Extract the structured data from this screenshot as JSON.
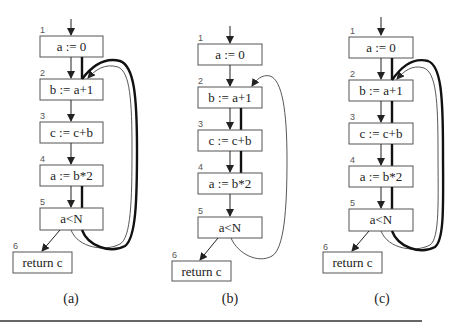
{
  "figure": {
    "diagrams": [
      {
        "caption": "(a)",
        "nodes": [
          {
            "num": "1",
            "label": "a := 0"
          },
          {
            "num": "2",
            "label": "b := a+1"
          },
          {
            "num": "3",
            "label": "c := c+b"
          },
          {
            "num": "4",
            "label": "a := b*2"
          },
          {
            "num": "5",
            "label": "a<N"
          },
          {
            "num": "6",
            "label": "return c"
          }
        ]
      },
      {
        "caption": "(b)",
        "nodes": [
          {
            "num": "1",
            "label": "a := 0"
          },
          {
            "num": "2",
            "label": "b := a+1"
          },
          {
            "num": "3",
            "label": "c := c+b"
          },
          {
            "num": "4",
            "label": "a := b*2"
          },
          {
            "num": "5",
            "label": "a<N"
          },
          {
            "num": "6",
            "label": "return c"
          }
        ]
      },
      {
        "caption": "(c)",
        "nodes": [
          {
            "num": "1",
            "label": "a := 0"
          },
          {
            "num": "2",
            "label": "b := a+1"
          },
          {
            "num": "3",
            "label": "c := c+b"
          },
          {
            "num": "4",
            "label": "a := b*2"
          },
          {
            "num": "5",
            "label": "a<N"
          },
          {
            "num": "6",
            "label": "return c"
          }
        ]
      }
    ]
  }
}
